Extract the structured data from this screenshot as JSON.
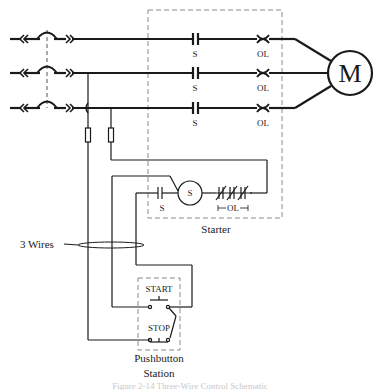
{
  "diagram": {
    "type": "three-wire motor control schematic",
    "motor": {
      "label": "M"
    },
    "power_lines": [
      {
        "contact_label": "S",
        "overload_label": "OL"
      },
      {
        "contact_label": "S",
        "overload_label": "OL"
      },
      {
        "contact_label": "S",
        "overload_label": "OL"
      }
    ],
    "control_circuit": {
      "aux_contact_label": "S",
      "coil_label": "S",
      "overload_contacts_label": "OL"
    },
    "starter": {
      "label": "Starter"
    },
    "cable": {
      "label": "3 Wires"
    },
    "pushbutton_station": {
      "start_label": "START",
      "stop_label": "STOP",
      "label_line1": "Pushbutton",
      "label_line2": "Station"
    },
    "caption": "Figure 2-14 Three-Wire Control Schematic"
  }
}
